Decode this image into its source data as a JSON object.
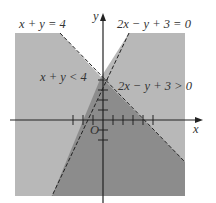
{
  "graph": {
    "colors": {
      "light_region": "#b8b8b8",
      "dark_region": "#8c8c8c",
      "axis": "#222222",
      "dashed_line": "#222222",
      "text": "#333333"
    },
    "axes": {
      "x_label": "x",
      "y_label": "y",
      "origin_label": "O"
    },
    "lines": [
      {
        "equation": "x + y = 4",
        "style": "dashed"
      },
      {
        "equation": "2x − y + 3 = 0",
        "style": "dashed"
      }
    ],
    "region_labels": [
      {
        "text": "x + y < 4"
      },
      {
        "text": "2x − y + 3 > 0"
      }
    ]
  }
}
